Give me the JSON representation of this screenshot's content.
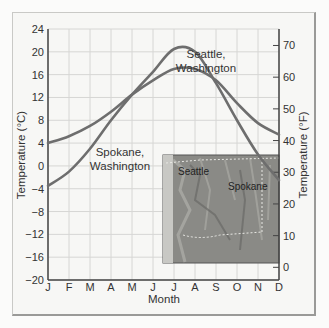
{
  "chart_data": {
    "type": "line",
    "title": "",
    "xlabel": "Month",
    "ylabel": "Temperature (°C)",
    "ylabel_right": "Temperature (°F)",
    "categories": [
      "J",
      "F",
      "M",
      "A",
      "M",
      "J",
      "J",
      "A",
      "S",
      "O",
      "N",
      "D"
    ],
    "ylim": [
      -20,
      24
    ],
    "yticks": [
      24,
      20,
      16,
      12,
      8,
      4,
      0,
      -4,
      -8,
      -12,
      -16,
      -20
    ],
    "yticks_right": [
      70,
      60,
      50,
      40,
      30,
      20,
      10,
      0
    ],
    "grid": true,
    "series": [
      {
        "name": "Seattle, Washington",
        "values": [
          4,
          5.2,
          7,
          9.5,
          12.5,
          15,
          17,
          17,
          15,
          11,
          7.5,
          5.5
        ]
      },
      {
        "name": "Spokane, Washington",
        "values": [
          -3.5,
          -1,
          3,
          8,
          12.5,
          16.5,
          20.5,
          20,
          14.5,
          8,
          2,
          -2.5
        ]
      }
    ],
    "annotations": [
      {
        "text": "Seattle, Washington",
        "near": "Jul-Aug, below Seattle peak"
      },
      {
        "text": "Spokane, Washington",
        "near": "Mar-Apr, ~0°C"
      }
    ],
    "inset": {
      "type": "relief map",
      "labels": [
        "Seattle",
        "Spokane"
      ]
    }
  },
  "labels": {
    "seattle_line1": "Seattle,",
    "seattle_line2": "Washington",
    "spokane_line1": "Spokane,",
    "spokane_line2": "Washington",
    "map_seattle": "Seattle",
    "map_spokane": "Spokane"
  },
  "colors": {
    "line": "#6e6e6e",
    "grid": "#d6d6d4",
    "axis": "#444444"
  }
}
